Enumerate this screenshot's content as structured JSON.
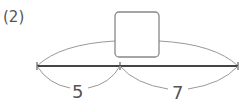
{
  "problem": {
    "label": "(2)",
    "segments": [
      {
        "name": "left",
        "value": "5"
      },
      {
        "name": "right",
        "value": "7"
      }
    ],
    "total_box": {
      "value": ""
    },
    "colors": {
      "line": "#444444",
      "arc": "#999999",
      "box": "#888888",
      "text": "#555555"
    }
  }
}
